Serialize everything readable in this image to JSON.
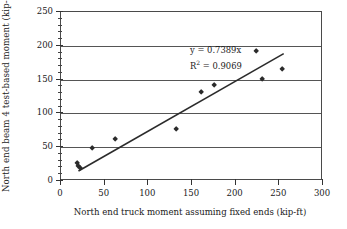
{
  "chart_data": {
    "type": "scatter",
    "title": "",
    "xlabel": "North end truck moment assuming fixed ends (kip-ft)",
    "ylabel": "North end beam 4 test-based moment (kip-ft)",
    "xlim": [
      0,
      300
    ],
    "ylim": [
      0,
      250
    ],
    "xticks": [
      0,
      50,
      100,
      150,
      200,
      250,
      300
    ],
    "yticks": [
      0,
      50,
      100,
      150,
      200,
      250
    ],
    "xtick_labels": [
      "0",
      "50",
      "100",
      "150",
      "200",
      "250",
      "300"
    ],
    "ytick_labels": [
      "0",
      "50",
      "100",
      "150",
      "200",
      "250"
    ],
    "xtick_minor_step": 10,
    "ytick_minor_step": 10,
    "grid": "horizontal",
    "legend": "none",
    "marker": "diamond",
    "marker_color": "#2b2b2b",
    "points": [
      {
        "x": 18,
        "y": 27
      },
      {
        "x": 20,
        "y": 22
      },
      {
        "x": 22,
        "y": 19
      },
      {
        "x": 36,
        "y": 48
      },
      {
        "x": 62,
        "y": 62
      },
      {
        "x": 132,
        "y": 77
      },
      {
        "x": 160,
        "y": 132
      },
      {
        "x": 175,
        "y": 141
      },
      {
        "x": 223,
        "y": 192
      },
      {
        "x": 230,
        "y": 151
      },
      {
        "x": 253,
        "y": 166
      }
    ],
    "trendline": {
      "type": "linear-through-origin",
      "slope": 0.7389,
      "intercept": 0,
      "x_start": 20,
      "x_end": 255,
      "color": "#2b2b2b"
    },
    "annotations": [
      {
        "name": "equation",
        "text": "y = 0.7389x"
      },
      {
        "name": "r-squared",
        "text_prefix": "R",
        "text_sup": "2",
        "text_suffix": " = 0.9069"
      }
    ]
  },
  "annotations": {
    "equation": "y = 0.7389x",
    "r2_prefix": "R",
    "r2_sup": "2",
    "r2_suffix": " = 0.9069"
  }
}
